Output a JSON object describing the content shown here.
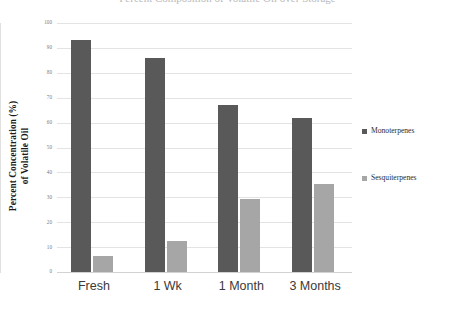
{
  "chart_data": {
    "type": "bar",
    "title": "Percent Composition of Volatile Oil over Storage",
    "categories": [
      "Fresh",
      "1 Wk",
      "1 Month",
      "3 Months"
    ],
    "series": [
      {
        "name": "Monoterpenes",
        "color": "#595959",
        "values": [
          93,
          86,
          67,
          62
        ]
      },
      {
        "name": "Sesquiterpenes",
        "color": "#a6a6a6",
        "values": [
          6.5,
          12.5,
          29.5,
          35.5
        ]
      }
    ],
    "xlabel": "",
    "ylabel_line1": "Percent Concentration (%)",
    "ylabel_line2": "of Volatile Oil",
    "ylim": [
      0,
      100
    ],
    "yticks": [
      0,
      10,
      20,
      30,
      40,
      50,
      60,
      70,
      80,
      90,
      100
    ],
    "ytick_labels": [
      "0",
      "10",
      "20",
      "30",
      "40",
      "50",
      "60",
      "70",
      "80",
      "90",
      "100"
    ],
    "grid": true,
    "legend_position": "right",
    "gridline_color": "#e3e3e3",
    "axis_text_color": "#7a7a7a"
  }
}
